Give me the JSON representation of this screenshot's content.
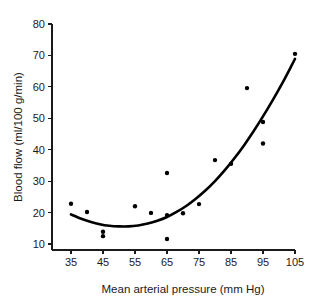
{
  "chart_data": {
    "type": "scatter",
    "title": "",
    "xlabel": "Mean arterial pressure (mm Hg)",
    "ylabel": "Blood flow (ml/100 g/min)",
    "xlim": [
      30,
      108
    ],
    "ylim": [
      5,
      80
    ],
    "xticks": [
      35,
      45,
      55,
      65,
      75,
      85,
      95,
      105
    ],
    "xtick_labels": [
      "35",
      "45",
      "55",
      "65",
      "75",
      "85",
      "95",
      "105"
    ],
    "yticks": [
      10,
      20,
      30,
      40,
      50,
      60,
      70,
      80
    ],
    "ytick_labels": [
      "10",
      "20",
      "30",
      "40",
      "50",
      "60",
      "70",
      "80"
    ],
    "grid": false,
    "legend": null,
    "marker_color": "#000000",
    "curve_color": "#000000",
    "points": [
      {
        "x": 35,
        "y": 22.8
      },
      {
        "x": 40,
        "y": 20.2
      },
      {
        "x": 45,
        "y": 13.9
      },
      {
        "x": 45,
        "y": 12.5
      },
      {
        "x": 55,
        "y": 22.0
      },
      {
        "x": 60,
        "y": 19.9
      },
      {
        "x": 65,
        "y": 32.6
      },
      {
        "x": 65,
        "y": 19.2
      },
      {
        "x": 65,
        "y": 11.6
      },
      {
        "x": 70,
        "y": 19.8
      },
      {
        "x": 75,
        "y": 22.7
      },
      {
        "x": 80,
        "y": 36.7
      },
      {
        "x": 85,
        "y": 35.5
      },
      {
        "x": 90,
        "y": 59.6
      },
      {
        "x": 95,
        "y": 48.8
      },
      {
        "x": 95,
        "y": 42.0
      },
      {
        "x": 105,
        "y": 70.5
      }
    ],
    "curve": [
      {
        "x": 35,
        "y": 19.4
      },
      {
        "x": 38,
        "y": 18.1
      },
      {
        "x": 41,
        "y": 17.1
      },
      {
        "x": 44,
        "y": 16.3
      },
      {
        "x": 47,
        "y": 15.8
      },
      {
        "x": 50,
        "y": 15.6
      },
      {
        "x": 53,
        "y": 15.6
      },
      {
        "x": 56,
        "y": 15.9
      },
      {
        "x": 59,
        "y": 16.5
      },
      {
        "x": 62,
        "y": 17.4
      },
      {
        "x": 65,
        "y": 18.6
      },
      {
        "x": 68,
        "y": 20.2
      },
      {
        "x": 71,
        "y": 22.1
      },
      {
        "x": 74,
        "y": 24.4
      },
      {
        "x": 77,
        "y": 27.0
      },
      {
        "x": 80,
        "y": 30.0
      },
      {
        "x": 83,
        "y": 33.4
      },
      {
        "x": 86,
        "y": 37.2
      },
      {
        "x": 89,
        "y": 41.3
      },
      {
        "x": 92,
        "y": 45.8
      },
      {
        "x": 95,
        "y": 50.6
      },
      {
        "x": 98,
        "y": 55.7
      },
      {
        "x": 101,
        "y": 61.1
      },
      {
        "x": 104,
        "y": 66.9
      },
      {
        "x": 105,
        "y": 68.9
      }
    ]
  }
}
